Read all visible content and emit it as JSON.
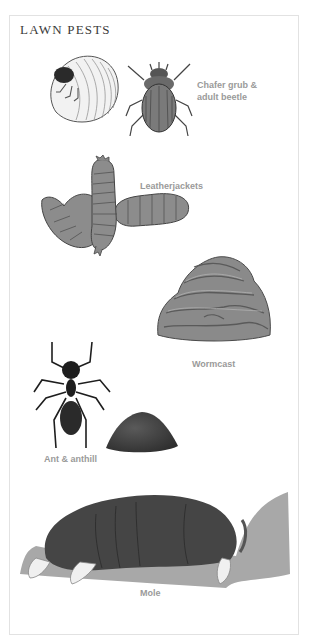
{
  "page": {
    "title": "LAWN PESTS",
    "items": [
      {
        "name": "chafer",
        "label_line1": "Chafer grub &",
        "label_line2": "adult beetle"
      },
      {
        "name": "leatherjackets",
        "label": "Leatherjackets"
      },
      {
        "name": "wormcast",
        "label": "Wormcast"
      },
      {
        "name": "ant",
        "label": "Ant & anthill"
      },
      {
        "name": "mole",
        "label": "Mole"
      }
    ]
  },
  "colors": {
    "title": "#3a3a3a",
    "label": "#9a9a9a",
    "border": "#e2e2e2",
    "illustration_dark": "#2a2a2a",
    "illustration_mid": "#7a7a7a",
    "illustration_light": "#bdbdbd"
  }
}
